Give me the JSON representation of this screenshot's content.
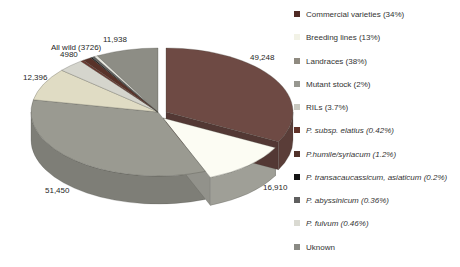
{
  "figure": {
    "background": "#ffffff",
    "description_labels": "3D exploded pie chart with value callouts and right-hand legend"
  },
  "chart_data": {
    "type": "pie",
    "style": "3d-exploded",
    "legend_position": "right",
    "total": 150648,
    "slices": [
      {
        "name": "commercial-varieties",
        "value": 49248,
        "color": "#6e4a44",
        "exploded": true,
        "offset": [
          8,
          0
        ]
      },
      {
        "name": "breeding-lines",
        "value": 16910,
        "color": "#fcfcf3",
        "side": "#9f9f97",
        "exploded": true,
        "offset": [
          5,
          6
        ]
      },
      {
        "name": "landraces",
        "value": 51450,
        "color": "#9a9a91",
        "exploded": false,
        "offset": [
          0,
          0
        ]
      },
      {
        "name": "mutant-stock",
        "value": 12396,
        "color": "#e0dcc4",
        "exploded": false,
        "offset": [
          0,
          0
        ]
      },
      {
        "name": "rils",
        "value": 4980,
        "color": "#d5d5cd",
        "exploded": false,
        "offset": [
          0,
          0
        ]
      },
      {
        "name": "p-subsp-elatius",
        "value": 593,
        "color": "#6b382f",
        "exploded": false,
        "offset": [
          0,
          0
        ]
      },
      {
        "name": "p-humile-syriacum",
        "value": 1694,
        "color": "#583229",
        "exploded": false,
        "offset": [
          0,
          0
        ]
      },
      {
        "name": "p-transacaucassicum-asiaticum",
        "value": 282,
        "color": "#161616",
        "exploded": false,
        "offset": [
          0,
          0
        ]
      },
      {
        "name": "p-abyssinicum",
        "value": 508,
        "color": "#646464",
        "exploded": false,
        "offset": [
          0,
          0
        ]
      },
      {
        "name": "p-fulvum",
        "value": 649,
        "color": "#e6e6de",
        "exploded": false,
        "offset": [
          0,
          0
        ]
      },
      {
        "name": "unknown",
        "value": 11938,
        "color": "#8d8d85",
        "exploded": false,
        "offset": [
          0,
          0
        ]
      }
    ],
    "wild_group_label": "All wild (3726)",
    "point_labels": [
      {
        "text": "11,938",
        "x": 103,
        "y": 35
      },
      {
        "text": "All wild (3726)",
        "x": 51,
        "y": 43
      },
      {
        "text": "4980",
        "x": 60,
        "y": 50
      },
      {
        "text": "12,396",
        "x": 23,
        "y": 73
      },
      {
        "text": "51,450",
        "x": 45,
        "y": 186
      },
      {
        "text": "16,910",
        "x": 263,
        "y": 183
      },
      {
        "text": "49,248",
        "x": 250,
        "y": 53
      }
    ],
    "legend": [
      {
        "name": "commercial-varieties",
        "label": "Commercial varieties (34%)",
        "swatch": "#4f2a24",
        "italic": false
      },
      {
        "name": "breeding-lines",
        "label": "Breeding lines (13%)",
        "swatch": "#f2f2e6",
        "italic": false
      },
      {
        "name": "landraces",
        "label": "Landraces (38%)",
        "swatch": "#8f8a80",
        "italic": false
      },
      {
        "name": "mutant-stock",
        "label": "Mutant stock (2%)",
        "swatch": "#979790",
        "italic": false
      },
      {
        "name": "rils",
        "label": "RILs (3.7%)",
        "swatch": "#c8c8c0",
        "italic": false
      },
      {
        "name": "p-subsp-elatius",
        "label": "P. subsp. elatius (0.42%)",
        "swatch": "#613229",
        "italic": true
      },
      {
        "name": "p-humile-syriacum",
        "label": "P.humile/syriacum (1.2%)",
        "swatch": "#51322a",
        "italic": true
      },
      {
        "name": "p-transacaucassicum-asiaticum",
        "label": "P. transacaucassicum, asiaticum (0.2%)",
        "swatch": "#141414",
        "italic": true
      },
      {
        "name": "p-abyssinicum",
        "label": "P. abyssinicum (0.36%)",
        "swatch": "#5f5f5f",
        "italic": true
      },
      {
        "name": "p-fulvum",
        "label": "P. fulvum (0.46%)",
        "swatch": "#dadad2",
        "italic": true
      },
      {
        "name": "unknown",
        "label": "Uknown",
        "swatch": "#8a8a84",
        "italic": false
      }
    ]
  }
}
